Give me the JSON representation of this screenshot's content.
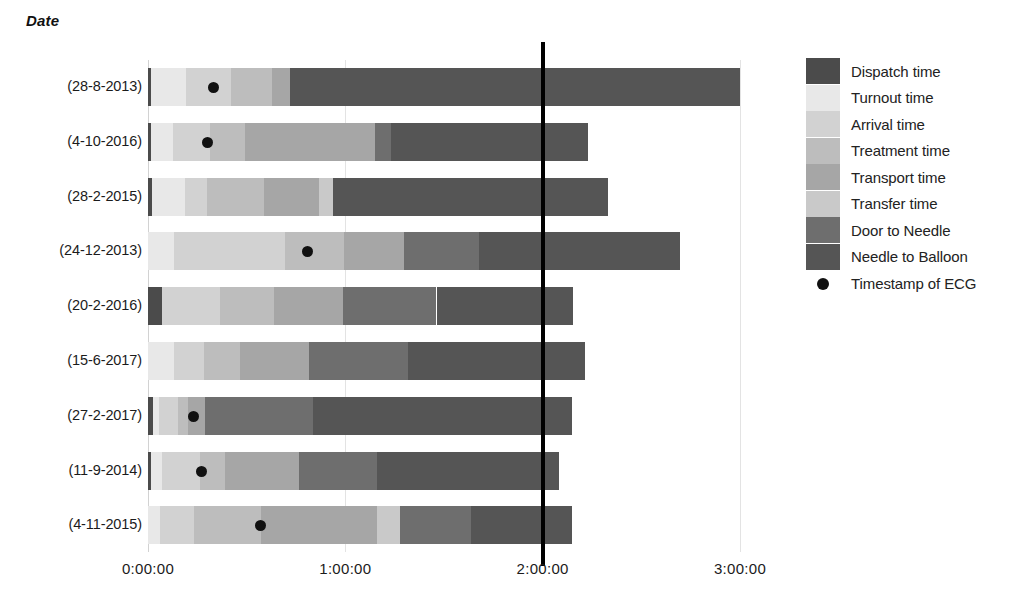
{
  "axis_title": "Date",
  "legend": {
    "items": [
      {
        "label": "Dispatch time",
        "color": "#4b4b4b",
        "type": "swatch"
      },
      {
        "label": "Turnout time",
        "color": "#e8e8e8",
        "type": "swatch"
      },
      {
        "label": "Arrival time",
        "color": "#d2d2d2",
        "type": "swatch"
      },
      {
        "label": "Treatment time",
        "color": "#bdbdbd",
        "type": "swatch"
      },
      {
        "label": "Transport time",
        "color": "#a6a6a6",
        "type": "swatch"
      },
      {
        "label": "Transfer time",
        "color": "#c9c9c9",
        "type": "swatch"
      },
      {
        "label": "Door to Needle",
        "color": "#6e6e6e",
        "type": "swatch"
      },
      {
        "label": "Needle to Balloon",
        "color": "#555555",
        "type": "swatch"
      },
      {
        "label": "Timestamp of ECG",
        "color": "#111111",
        "type": "marker"
      }
    ]
  },
  "chart_data": {
    "type": "bar",
    "orientation": "horizontal",
    "stacked": true,
    "title": "",
    "xlabel": "",
    "ylabel": "Date",
    "grid": true,
    "legend_position": "right",
    "xlim_hours": [
      0,
      3.0
    ],
    "x_tick_labels": [
      "0:00:00",
      "1:00:00",
      "2:00:00",
      "3:00:00"
    ],
    "x_tick_hours": [
      0,
      1,
      2,
      3
    ],
    "benchmark_hours": 2.0,
    "benchmark_label": "2:00:00",
    "categories": [
      "(28-8-2013)",
      "(4-10-2016)",
      "(28-2-2015)",
      "(24-12-2013)",
      "(20-2-2016)",
      "(15-6-2017)",
      "(27-2-2017)",
      "(11-9-2014)",
      "(4-11-2015)"
    ],
    "series": [
      {
        "name": "Dispatch time",
        "color": "#4b4b4b",
        "values": [
          0.017,
          0.015,
          0.02,
          0.0,
          0.072,
          0.0,
          0.025,
          0.017,
          0.0
        ]
      },
      {
        "name": "Turnout time",
        "color": "#e8e8e8",
        "values": [
          0.175,
          0.112,
          0.17,
          0.133,
          0.0,
          0.132,
          0.03,
          0.055,
          0.06
        ]
      },
      {
        "name": "Arrival time",
        "color": "#d2d2d2",
        "values": [
          0.228,
          0.186,
          0.11,
          0.56,
          0.295,
          0.15,
          0.095,
          0.19,
          0.175
        ]
      },
      {
        "name": "Treatment time",
        "color": "#bdbdbd",
        "values": [
          0.21,
          0.18,
          0.29,
          0.3,
          0.27,
          0.185,
          0.055,
          0.13,
          0.338
        ]
      },
      {
        "name": "Transport time",
        "color": "#a6a6a6",
        "values": [
          0.09,
          0.655,
          0.275,
          0.305,
          0.35,
          0.35,
          0.085,
          0.375,
          0.585
        ]
      },
      {
        "name": "Transfer time",
        "color": "#c9c9c9",
        "values": [
          0.0,
          0.0,
          0.075,
          0.0,
          0.0,
          0.0,
          0.0,
          0.0,
          0.118
        ]
      },
      {
        "name": "Door to Needle",
        "color": "#6e6e6e",
        "values": [
          0.0,
          0.082,
          0.0,
          0.38,
          0.475,
          0.5,
          0.545,
          0.395,
          0.36
        ]
      },
      {
        "name": "Needle to Balloon",
        "color": "#555555",
        "values": [
          2.28,
          1.0,
          1.39,
          1.02,
          0.69,
          0.9,
          1.315,
          0.92,
          0.515
        ]
      }
    ],
    "totals_hours": [
      3.0,
      2.23,
      2.33,
      2.698,
      2.152,
      2.217,
      2.15,
      2.082,
      2.151
    ],
    "ecg_timestamp_hours": [
      0.33,
      0.3,
      null,
      0.81,
      null,
      null,
      0.23,
      0.27,
      0.57
    ]
  }
}
